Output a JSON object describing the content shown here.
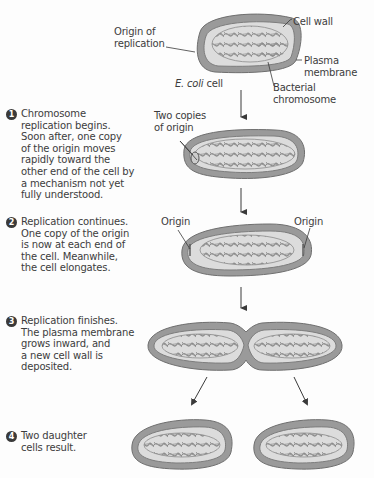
{
  "diagram": {
    "labels": {
      "origin_of_replication": "Origin of\nreplication",
      "cell_wall": "Cell wall",
      "plasma_membrane": "Plasma\nmembrane",
      "ecoli_italic": "E. coli",
      "ecoli_suffix": " cell",
      "bacterial_chromosome": "Bacterial\nchromosome",
      "two_copies_of_origin": "Two copies\nof origin",
      "origin_left": "Origin",
      "origin_right": "Origin"
    },
    "steps": [
      {
        "number": "1",
        "text": "Chromosome\nreplication begins.\nSoon after, one copy\nof the origin moves\nrapidly toward the\nother end of the cell by\na mechanism not yet\nfully understood."
      },
      {
        "number": "2",
        "text": "Replication continues.\nOne copy of the origin\nis now at each end of\nthe cell. Meanwhile,\nthe cell elongates."
      },
      {
        "number": "3",
        "text": "Replication finishes.\nThe plasma membrane\ngrows inward, and\na new cell wall is\ndeposited."
      },
      {
        "number": "4",
        "text": "Two daughter\ncells result."
      }
    ],
    "colors": {
      "cell_wall": "#8a8a8a",
      "cell_wall_stroke": "#6f6f6f",
      "membrane_fill": "#d9d9d9",
      "chromosome": "#8c8c8c",
      "text": "#3c3c3c",
      "arrow": "#3a3a3a"
    }
  }
}
